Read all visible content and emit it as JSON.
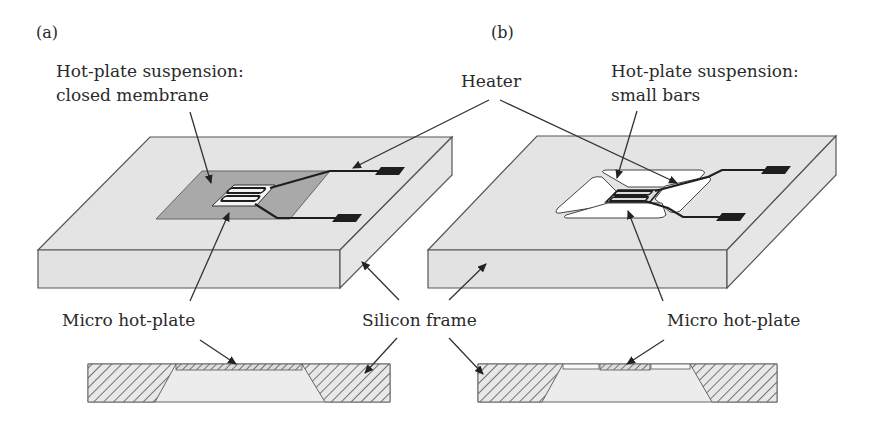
{
  "figure": {
    "panels": [
      {
        "id": "a",
        "label": "(a)"
      },
      {
        "id": "b",
        "label": "(b)"
      }
    ],
    "labels": {
      "suspension_a_line1": "Hot-plate suspension:",
      "suspension_a_line2": "closed membrane",
      "heater": "Heater",
      "suspension_b_line1": "Hot-plate suspension:",
      "suspension_b_line2": "small bars",
      "micro_hotplate_a": "Micro hot-plate",
      "silicon_frame": "Silicon frame",
      "micro_hotplate_b": "Micro hot-plate"
    },
    "colors": {
      "silicon": "#e4e4e4",
      "membrane": "#a9a9a9",
      "heater_track": "#1e1e1e",
      "cavity": "#ededed",
      "hatch": "#555555"
    }
  }
}
